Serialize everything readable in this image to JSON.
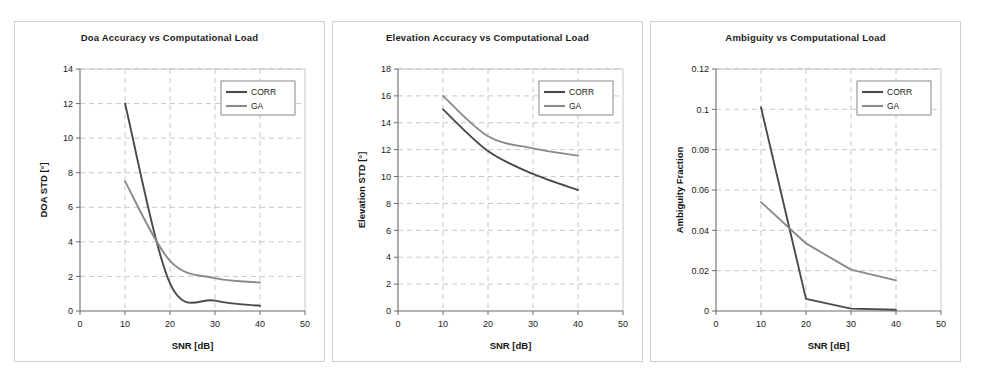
{
  "figure": {
    "panel_count": 3,
    "background_color": "#ffffff",
    "panel_border_color": "#cfcfcf",
    "grid_color": "#b9b9b9",
    "axis_color": "#6b6b6b"
  },
  "series_colors": {
    "CORR": "#4a4a4a",
    "GA": "#8a8a8a"
  },
  "chart_data": [
    {
      "type": "line",
      "title": "Doa Accuracy vs Computational Load",
      "xlabel": "SNR [dB]",
      "ylabel": "DOA STD [°]",
      "x": [
        10,
        20,
        30,
        40
      ],
      "xlim": [
        0,
        50
      ],
      "ylim": [
        0,
        14
      ],
      "xticks": [
        0,
        10,
        20,
        30,
        40,
        50
      ],
      "yticks": [
        0,
        2,
        4,
        6,
        8,
        10,
        12,
        14
      ],
      "xticklabels": [
        "0",
        "10",
        "20",
        "30",
        "40",
        "50"
      ],
      "yticklabels": [
        "0",
        "2",
        "4",
        "6",
        "8",
        "10",
        "12",
        "14"
      ],
      "grid": true,
      "legend_position": "upper right",
      "series": [
        {
          "name": "CORR",
          "values": [
            12.0,
            1.6,
            0.6,
            0.3
          ],
          "color": "#4a4a4a"
        },
        {
          "name": "GA",
          "values": [
            7.5,
            2.9,
            1.9,
            1.65
          ],
          "color": "#8a8a8a"
        }
      ]
    },
    {
      "type": "line",
      "title": "Elevation Accuracy vs Computational Load",
      "xlabel": "SNR [dB]",
      "ylabel": "Elevation STD [°]",
      "x": [
        10,
        20,
        30,
        40
      ],
      "xlim": [
        0,
        50
      ],
      "ylim": [
        0,
        18
      ],
      "xticks": [
        0,
        10,
        20,
        30,
        40,
        50
      ],
      "yticks": [
        0,
        2,
        4,
        6,
        8,
        10,
        12,
        14,
        16,
        18
      ],
      "xticklabels": [
        "0",
        "10",
        "20",
        "30",
        "40",
        "50"
      ],
      "yticklabels": [
        "0",
        "2",
        "4",
        "6",
        "8",
        "10",
        "12",
        "14",
        "16",
        "18"
      ],
      "grid": true,
      "legend_position": "upper right",
      "series": [
        {
          "name": "CORR",
          "values": [
            15.0,
            11.9,
            10.2,
            9.0
          ],
          "color": "#4a4a4a"
        },
        {
          "name": "GA",
          "values": [
            16.0,
            13.0,
            12.1,
            11.55
          ],
          "color": "#8a8a8a"
        }
      ]
    },
    {
      "type": "line",
      "title": "Ambiguity vs Computational Load",
      "xlabel": "SNR [dB]",
      "ylabel": "Ambiguity Fraction",
      "x": [
        10,
        20,
        30,
        40
      ],
      "xlim": [
        0,
        50
      ],
      "ylim": [
        0,
        0.12
      ],
      "xticks": [
        0,
        10,
        20,
        30,
        40,
        50
      ],
      "yticks": [
        0,
        0.02,
        0.04,
        0.06,
        0.08,
        0.1,
        0.12
      ],
      "xticklabels": [
        "0",
        "10",
        "20",
        "30",
        "40",
        "50"
      ],
      "yticklabels": [
        "0",
        "0.02",
        "0.04",
        "0.06",
        "0.08",
        "0.1",
        "0.12"
      ],
      "grid": true,
      "legend_position": "upper right",
      "series": [
        {
          "name": "CORR",
          "values": [
            0.101,
            0.006,
            0.0012,
            0.0006
          ],
          "color": "#4a4a4a"
        },
        {
          "name": "GA",
          "values": [
            0.054,
            0.0335,
            0.0205,
            0.0152
          ],
          "color": "#8a8a8a"
        }
      ]
    }
  ]
}
